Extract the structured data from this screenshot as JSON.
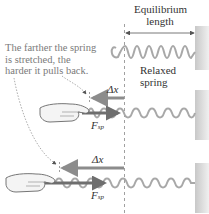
{
  "labels": {
    "equilibrium_line1": "Equilibrium",
    "equilibrium_line2": "length",
    "relaxed_line1": "Relaxed",
    "relaxed_line2": "spring",
    "note_line1": "The farther the spring",
    "note_line2": "is stretched, the",
    "note_line3": "harder it pulls back.",
    "delta_x": "Δx",
    "force_symbol": "F",
    "force_subscript": "sp"
  },
  "colors": {
    "spring": "#a8a8a8",
    "wall": "#d8d8d8",
    "delta_x_arrow": "#8c8c8c",
    "force_arrow": "#6e6e6e",
    "hand": "#f4f4f4",
    "note_text": "#7a7a7a"
  }
}
